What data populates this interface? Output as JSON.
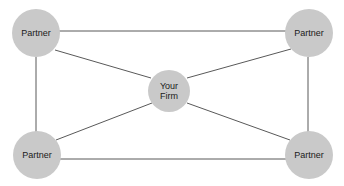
{
  "diagram": {
    "type": "network-hub-and-spoke",
    "canvas": {
      "width": 344,
      "height": 186,
      "background": "#ffffff"
    },
    "style": {
      "node_fill": "#c9c9c9",
      "edge_color": "#595959",
      "edge_width": 1,
      "label_color": "#1a1a1a",
      "label_font_size": 9
    },
    "nodes": [
      {
        "id": "partner-top-left",
        "label": "Partner",
        "cx": 36,
        "cy": 33,
        "r": 24
      },
      {
        "id": "partner-top-right",
        "label": "Partner",
        "cx": 309,
        "cy": 33,
        "r": 24
      },
      {
        "id": "your-firm",
        "label": "Your\nFirm",
        "cx": 169,
        "cy": 91,
        "r": 21
      },
      {
        "id": "partner-bottom-left",
        "label": "Partner",
        "cx": 37,
        "cy": 155,
        "r": 24
      },
      {
        "id": "partner-bottom-right",
        "label": "Partner",
        "cx": 309,
        "cy": 155,
        "r": 24
      }
    ],
    "edges": [
      {
        "id": "edge-top",
        "from": "partner-top-left",
        "to": "partner-top-right"
      },
      {
        "id": "edge-bottom",
        "from": "partner-bottom-left",
        "to": "partner-bottom-right"
      },
      {
        "id": "edge-left",
        "from": "partner-top-left",
        "to": "partner-bottom-left"
      },
      {
        "id": "edge-right",
        "from": "partner-top-right",
        "to": "partner-bottom-right"
      },
      {
        "id": "edge-firm-topleft",
        "from": "your-firm",
        "to": "partner-top-left"
      },
      {
        "id": "edge-firm-topright",
        "from": "your-firm",
        "to": "partner-top-right"
      },
      {
        "id": "edge-firm-bottomleft",
        "from": "your-firm",
        "to": "partner-bottom-left"
      },
      {
        "id": "edge-firm-bottomright",
        "from": "your-firm",
        "to": "partner-bottom-right"
      }
    ]
  }
}
